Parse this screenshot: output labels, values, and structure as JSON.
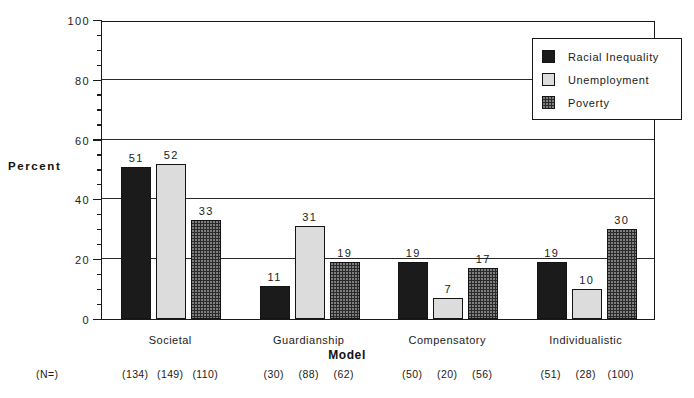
{
  "chart_data": {
    "type": "bar",
    "title": "",
    "xlabel": "Model",
    "ylabel": "Percent",
    "ylim": [
      0,
      100
    ],
    "ytick_labels": [
      "0",
      "20",
      "40",
      "60",
      "80",
      "100"
    ],
    "ytick_values": [
      0,
      20,
      40,
      60,
      80,
      100
    ],
    "yminor_step": 5,
    "grid": "horizontal",
    "legend_position": "top-right",
    "categories": [
      "Societal",
      "Guardianship",
      "Compensatory",
      "Individualistic"
    ],
    "series": [
      {
        "name": "Racial Inequality",
        "color": "#1b1b1b",
        "pattern": "solid-dark",
        "values": [
          51,
          11,
          19,
          19
        ],
        "n": [
          134,
          30,
          50,
          51
        ]
      },
      {
        "name": "Unemployment",
        "color": "#dcdcdc",
        "pattern": "light-stipple",
        "values": [
          52,
          31,
          7,
          10
        ],
        "n": [
          149,
          88,
          20,
          28
        ]
      },
      {
        "name": "Poverty",
        "color": "#2a2a2a",
        "pattern": "dark-dotted",
        "values": [
          33,
          19,
          17,
          30
        ],
        "n": [
          110,
          62,
          56,
          100
        ]
      }
    ],
    "n_row_label": "(N=)",
    "n_row_values": [
      [
        "(134)",
        "(149)",
        "(110)"
      ],
      [
        "(30)",
        "(88)",
        "(62)"
      ],
      [
        "(50)",
        "(20)",
        "(56)"
      ],
      [
        "(51)",
        "(28)",
        "(100)"
      ]
    ],
    "bar_value_labels": [
      [
        "51",
        "52",
        "33"
      ],
      [
        "11",
        "31",
        "19"
      ],
      [
        "19",
        "7",
        "17"
      ],
      [
        "19",
        "10",
        "30"
      ]
    ]
  }
}
